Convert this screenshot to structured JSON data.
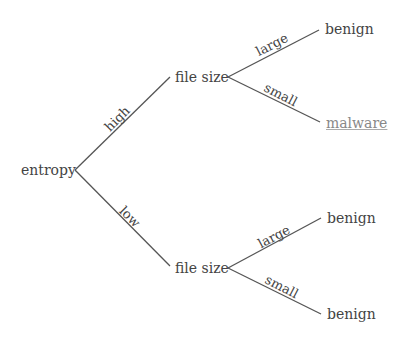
{
  "tree": {
    "root": {
      "label": "entropy"
    },
    "branches": [
      {
        "edge_label": "high",
        "node": {
          "label": "file size"
        },
        "children": [
          {
            "edge_label": "large",
            "leaf": "benign"
          },
          {
            "edge_label": "small",
            "leaf": "malware",
            "highlighted": true
          }
        ]
      },
      {
        "edge_label": "low",
        "node": {
          "label": "file size"
        },
        "children": [
          {
            "edge_label": "large",
            "leaf": "benign"
          },
          {
            "edge_label": "small",
            "leaf": "benign"
          }
        ]
      }
    ]
  },
  "colors": {
    "line": "#555555",
    "text": "#444444",
    "highlight_leaf": "#888888"
  }
}
